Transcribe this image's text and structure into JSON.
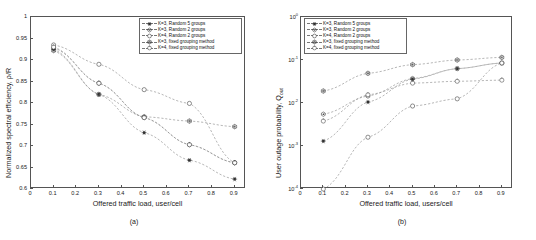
{
  "figure": {
    "panel_a_caption": "(a)",
    "panel_b_caption": "(b)"
  },
  "chart_data": [
    {
      "type": "line",
      "panel": "a",
      "title": "",
      "xlabel": "Offered traffic load, user/cell",
      "ylabel": "Normalized spectral efficiency, ρ/R",
      "xlim": [
        0,
        0.95
      ],
      "ylim": [
        0.6,
        1.0
      ],
      "xticks": [
        "0",
        "0.1",
        "0.2",
        "0.3",
        "0.4",
        "0.5",
        "0.6",
        "0.7",
        "0.8",
        "0.9"
      ],
      "xtickvals": [
        0,
        0.1,
        0.2,
        0.3,
        0.4,
        0.5,
        0.6,
        0.7,
        0.8,
        0.9
      ],
      "yticks": [
        "0.6",
        "0.65",
        "0.7",
        "0.75",
        "0.8",
        "0.85",
        "0.9",
        "0.95",
        "1"
      ],
      "ytickvals": [
        0.6,
        0.65,
        0.7,
        0.75,
        0.8,
        0.85,
        0.9,
        0.95,
        1.0
      ],
      "yscale": "linear",
      "grid": false,
      "legend_position": "top-right",
      "x": [
        0.1,
        0.3,
        0.5,
        0.7,
        0.9
      ],
      "series": [
        {
          "name": "K=3, Random 5 groups",
          "marker": "star",
          "values": [
            0.925,
            0.82,
            0.731,
            0.667,
            0.623
          ]
        },
        {
          "name": "K=3, Random 2 groups",
          "marker": "hexagon",
          "values": [
            0.928,
            0.846,
            0.766,
            0.703,
            0.661
          ]
        },
        {
          "name": "K=4, Random 2 groups",
          "marker": "circle",
          "values": [
            0.935,
            0.89,
            0.831,
            0.799,
            0.661
          ]
        },
        {
          "name": "K=3, fixed grouping method",
          "marker": "hexstar",
          "values": [
            0.922,
            0.82,
            0.768,
            0.758,
            0.745
          ]
        },
        {
          "name": "K=4, fixed grouping method",
          "marker": "circle-open",
          "values": [
            0.93,
            0.846,
            0.766,
            0.703,
            0.661
          ]
        }
      ]
    },
    {
      "type": "line",
      "panel": "b",
      "title": "",
      "xlabel": "Offered traffic load, users/cell",
      "ylabel": "User outage probability, Q_out",
      "xlim": [
        0,
        0.95
      ],
      "ylim": [
        0.0001,
        1.0
      ],
      "xticks": [
        "0",
        "0.1",
        "0.2",
        "0.3",
        "0.4",
        "0.5",
        "0.6",
        "0.7",
        "0.8",
        "0.9"
      ],
      "xtickvals": [
        0,
        0.1,
        0.2,
        0.3,
        0.4,
        0.5,
        0.6,
        0.7,
        0.8,
        0.9
      ],
      "yticks": [
        "10^0",
        "10^-1",
        "10^-2",
        "10^-3",
        "10^-4"
      ],
      "ytickvals": [
        1,
        0.1,
        0.01,
        0.001,
        0.0001
      ],
      "yscale": "log",
      "grid": false,
      "legend_position": "top-left",
      "x": [
        0.1,
        0.3,
        0.5,
        0.7,
        0.9
      ],
      "series": [
        {
          "name": "K=3, Random 5 groups",
          "marker": "star",
          "values": [
            0.0013,
            0.0105,
            0.036,
            0.063,
            0.085
          ]
        },
        {
          "name": "K=3, Random 2 groups",
          "marker": "hexagon",
          "values": [
            0.0055,
            0.0145,
            0.037,
            0.063,
            0.085
          ]
        },
        {
          "name": "K=4, Random 2 groups",
          "marker": "circle",
          "values": [
            0.0001,
            0.0016,
            0.0085,
            0.0125,
            0.085
          ]
        },
        {
          "name": "K=3, fixed grouping method",
          "marker": "hexstar",
          "values": [
            0.019,
            0.049,
            0.078,
            0.1,
            0.115
          ]
        },
        {
          "name": "K=4, fixed grouping method",
          "marker": "circle-open",
          "values": [
            0.0038,
            0.0155,
            0.029,
            0.032,
            0.034
          ]
        }
      ]
    }
  ],
  "legend": {
    "items": [
      {
        "label": "K=3, Random 5 groups",
        "marker": "star"
      },
      {
        "label": "K=3, Random 2 groups",
        "marker": "hexagon"
      },
      {
        "label": "K=4, Random 2 groups",
        "marker": "circle"
      },
      {
        "label": "K=3, fixed grouping method",
        "marker": "hexstar"
      },
      {
        "label": "K=4, fixed grouping method",
        "marker": "circle-open"
      }
    ]
  }
}
